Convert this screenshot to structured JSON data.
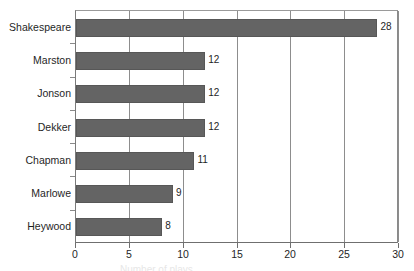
{
  "chart_data": {
    "type": "bar",
    "orientation": "horizontal",
    "title": "",
    "subtitle": "",
    "xlabel": "Number of plays",
    "ylabel": "",
    "categories": [
      "Shakespeare",
      "Marston",
      "Jonson",
      "Dekker",
      "Chapman",
      "Marlowe",
      "Heywood"
    ],
    "values": [
      28,
      12,
      12,
      12,
      11,
      9,
      8
    ],
    "data_labels": [
      "28",
      "12",
      "12",
      "12",
      "11",
      "9",
      "8"
    ],
    "xlim": [
      0,
      30
    ],
    "xticks": [
      0,
      5,
      10,
      15,
      20,
      25,
      30
    ],
    "xtick_labels": [
      "0",
      "5",
      "10",
      "15",
      "20",
      "25",
      "30"
    ],
    "grid": "vertical",
    "legend": "none",
    "bar_color": "#646464",
    "bar_edge_color": "#575757",
    "axis_color": "#6f6f6f",
    "gridline_color": "#8d8d8d",
    "text_color": "#1f1f1f",
    "background_color": "#ffffff"
  },
  "axis_title_fragment": "Number of plays"
}
